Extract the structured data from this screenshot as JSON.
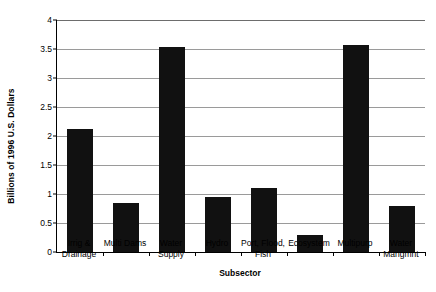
{
  "chart_data": {
    "type": "bar",
    "title": "",
    "xlabel": "Subsector",
    "ylabel": "Billions of 1996 U.S. Dollars",
    "categories": [
      "Irrig & Drainage",
      "Multi Dams",
      "Water Supply",
      "Hydro",
      "Port, Flood, Fish",
      "Ecosystem",
      "Multipurp",
      "Water Mangmnt"
    ],
    "category_lines": [
      [
        "Irrig &",
        "Drainage"
      ],
      [
        "Multi Dams"
      ],
      [
        "Water",
        "Supply"
      ],
      [
        "Hydro"
      ],
      [
        "Port, Flood,",
        "Fish"
      ],
      [
        "Ecosystem"
      ],
      [
        "Multipurp"
      ],
      [
        "Water",
        "Mangmnt"
      ]
    ],
    "values": [
      2.12,
      0.85,
      3.53,
      0.95,
      1.1,
      0.29,
      3.57,
      0.79
    ],
    "ylim": [
      0,
      4
    ],
    "ytick_labels": [
      "0",
      "0.5",
      "1",
      "1.5",
      "2",
      "2.5",
      "3",
      "3.5",
      "4"
    ],
    "ytick_values": [
      0,
      0.5,
      1,
      1.5,
      2,
      2.5,
      3,
      3.5,
      4
    ],
    "grid": true,
    "legend": "none",
    "bar_color": "#111111",
    "grid_color": "#9a9a9a",
    "axis_color": "#000000"
  }
}
